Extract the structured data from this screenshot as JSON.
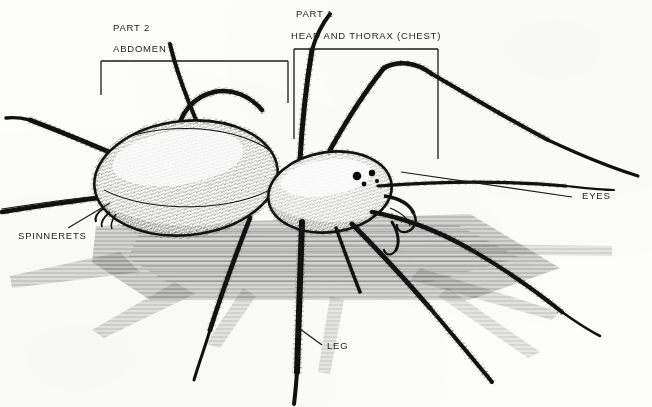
{
  "figure": {
    "style": "black-and-white line drawing",
    "background_color": "#fdfdfc",
    "ink_color": "#111111"
  },
  "annotations": {
    "part2_title": "PART 2",
    "part2_name": "ABDOMEN",
    "part1_title": "PART 1",
    "part1_name": "HEAD AND THORAX (CHEST)",
    "eyes": "EYES",
    "spinnerets": "SPINNERETS",
    "leg": "LEG"
  },
  "brackets": [
    {
      "name": "abdomen-bracket",
      "x1": 101,
      "x2": 288,
      "y": 61,
      "left_drop": 95,
      "right_drop": 103
    },
    {
      "name": "cephalothorax-bracket",
      "x1": 294,
      "x2": 438,
      "y": 49,
      "left_drop": 139,
      "right_drop": 159
    }
  ],
  "leaders": [
    {
      "name": "eyes-leader",
      "x1": 401,
      "y1": 172,
      "x2": 572,
      "y2": 197
    },
    {
      "name": "spinnerets-leader",
      "x1": 110,
      "y1": 203,
      "x2": 68,
      "y2": 228
    },
    {
      "name": "leg-leader",
      "x1": 300,
      "y1": 329,
      "x2": 322,
      "y2": 345
    }
  ],
  "label_positions": {
    "part2_title": {
      "x": 113,
      "y": 23
    },
    "part2_name": {
      "x": 113,
      "y": 44
    },
    "part1_title": {
      "x": 296,
      "y": 9
    },
    "part1_name": {
      "x": 291,
      "y": 31
    },
    "eyes": {
      "x": 582,
      "y": 191
    },
    "spinnerets": {
      "x": 18,
      "y": 231
    },
    "leg": {
      "x": 327,
      "y": 341
    }
  }
}
